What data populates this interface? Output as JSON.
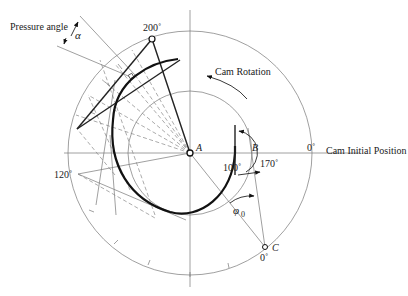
{
  "diagram": {
    "labels": {
      "pressure_angle": "Pressure angle",
      "alpha": "α",
      "angle_200": "200˚",
      "cam_rotation": "Cam Rotation",
      "point_a": "A",
      "point_b": "B",
      "zero_right": "0˚",
      "cam_initial_position": "Cam Initial Position",
      "angle_170": "170˚",
      "angle_100": "100˚",
      "angle_120": "120˚",
      "phi": "φ",
      "phi_sub": "0",
      "point_c": "C",
      "zero_bottom": "0˚"
    },
    "geometry": {
      "center_a": [
        190,
        153
      ],
      "outer_circle_radius": 122,
      "base_circle_radius": 62,
      "point_b": [
        235,
        153
      ],
      "point_c": [
        265,
        247
      ],
      "point_200": [
        152,
        39
      ],
      "point_120": [
        78,
        174
      ]
    },
    "colors": {
      "line": "#111111",
      "construction": "#888888",
      "background": "#ffffff"
    }
  }
}
